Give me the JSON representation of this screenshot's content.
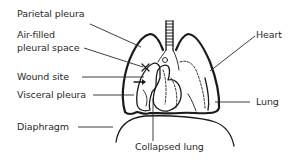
{
  "diagram": {
    "labels": {
      "parietal_pleura": "Parietal pleura",
      "air_filled_line1": "Air-filled",
      "air_filled_line2": "pleural space",
      "wound_site": "Wound site",
      "visceral_pleura": "Visceral pleura",
      "diaphragm": "Diaphragm",
      "heart": "Heart",
      "lung": "Lung",
      "collapsed_lung": "Collapsed lung"
    },
    "structures": [
      "trachea",
      "left-lung",
      "right-lung-collapsed",
      "heart",
      "diaphragm",
      "air-filled-pleural-space",
      "wound-site-marker",
      "air-entry-arrow"
    ],
    "colors": {
      "ink": "#1a1a1a",
      "text": "#2a2a2a",
      "background": "#ffffff"
    }
  }
}
